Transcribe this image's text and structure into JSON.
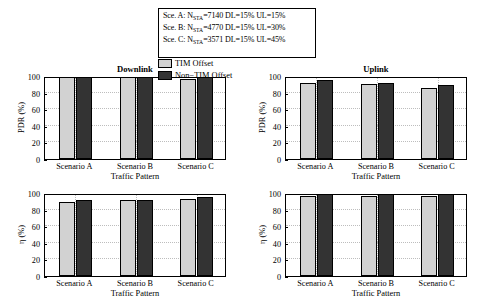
{
  "legend_box": {
    "lines": [
      {
        "prefix": "Sce. A: N",
        "sub": "STA",
        "suffix": "=7140 DL=15% UL=15%"
      },
      {
        "prefix": "Sce. B: N",
        "sub": "STA",
        "suffix": "=4770 DL=15% UL=30%"
      },
      {
        "prefix": "Sce. C: N",
        "sub": "STA",
        "suffix": "=3571 DL=15% UL=45%"
      }
    ]
  },
  "series_key": {
    "items": [
      {
        "label": "TIM Offset",
        "color": "#d2d2d2"
      },
      {
        "label": "Non−TIM Offset",
        "color": "#333333"
      }
    ]
  },
  "colors": {
    "tim_offset": "#d2d2d2",
    "non_tim_offset": "#333333",
    "axis": "#000000",
    "grid": "#bdbdbd",
    "background": "#ffffff"
  },
  "chart_data": [
    {
      "id": "downlink-pdr",
      "type": "bar",
      "title": "Downlink",
      "xlabel": "Traffic Pattern",
      "ylabel": "PDR (%)",
      "categories": [
        "Scenario A",
        "Scenario B",
        "Scenario C"
      ],
      "yticks": [
        0,
        20,
        40,
        60,
        80,
        100
      ],
      "ylim": [
        0,
        100
      ],
      "grid": true,
      "legend_position": "top-center-external",
      "series": [
        {
          "name": "TIM Offset",
          "color": "#d2d2d2",
          "values": [
            100,
            100,
            96
          ]
        },
        {
          "name": "Non−TIM Offset",
          "color": "#333333",
          "values": [
            100,
            100,
            100
          ]
        }
      ]
    },
    {
      "id": "uplink-pdr",
      "type": "bar",
      "title": "Uplink",
      "xlabel": "Traffic Pattern",
      "ylabel": "PDR (%)",
      "categories": [
        "Scenario A",
        "Scenario B",
        "Scenario C"
      ],
      "yticks": [
        0,
        20,
        40,
        60,
        80,
        100
      ],
      "ylim": [
        0,
        100
      ],
      "grid": true,
      "legend_position": "top-center-external",
      "series": [
        {
          "name": "TIM Offset",
          "color": "#d2d2d2",
          "values": [
            92,
            90,
            86
          ]
        },
        {
          "name": "Non−TIM Offset",
          "color": "#333333",
          "values": [
            95,
            92,
            89
          ]
        }
      ]
    },
    {
      "id": "downlink-eta",
      "type": "bar",
      "title": "",
      "xlabel": "Traffic Pattern",
      "ylabel": "η (%)",
      "categories": [
        "Scenario A",
        "Scenario B",
        "Scenario C"
      ],
      "yticks": [
        0,
        20,
        40,
        60,
        80,
        100
      ],
      "ylim": [
        0,
        100
      ],
      "grid": true,
      "series": [
        {
          "name": "TIM Offset",
          "color": "#d2d2d2",
          "values": [
            89,
            92,
            93
          ]
        },
        {
          "name": "Non−TIM Offset",
          "color": "#333333",
          "values": [
            91,
            92,
            95
          ]
        }
      ]
    },
    {
      "id": "uplink-eta",
      "type": "bar",
      "title": "",
      "xlabel": "Traffic Pattern",
      "ylabel": "η (%)",
      "categories": [
        "Scenario A",
        "Scenario B",
        "Scenario C"
      ],
      "yticks": [
        0,
        20,
        40,
        60,
        80,
        100
      ],
      "ylim": [
        0,
        100
      ],
      "grid": true,
      "series": [
        {
          "name": "TIM Offset",
          "color": "#d2d2d2",
          "values": [
            96,
            97,
            97
          ]
        },
        {
          "name": "Non−TIM Offset",
          "color": "#333333",
          "values": [
            100,
            100,
            100
          ]
        }
      ]
    }
  ]
}
